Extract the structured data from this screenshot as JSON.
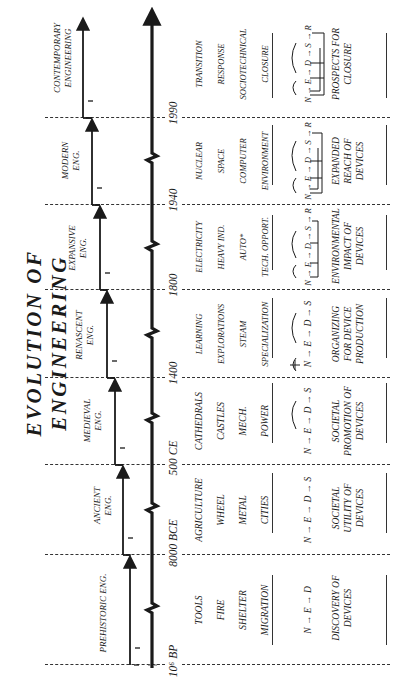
{
  "title": "EVOLUTION OF ENGINEERING",
  "eras": [
    {
      "name": "PREHISTORIC ENG.",
      "start": "10⁶ BP",
      "items": [
        "TOOLS",
        "FIRE",
        "SHELTER",
        "MIGRATION"
      ],
      "equation": "N → E → D",
      "summary": "DISCOVERY OF DEVICES"
    },
    {
      "name": "ANCIENT ENG.",
      "start": "8000 BCE",
      "items": [
        "AGRICULTURE",
        "WHEEL",
        "METAL",
        "CITIES"
      ],
      "equation": "N → E → D → S",
      "summary": "SOCIETAL UTILITY OF DEVICES"
    },
    {
      "name": "MEDIEVAL ENG.",
      "start": "500 CE",
      "items": [
        "CATHEDRALS",
        "CASTLES",
        "MECH.",
        "POWER"
      ],
      "equation": "N → E → D → S",
      "summary": "SOCIETAL PROMOTION OF DEVICES"
    },
    {
      "name": "RENASCENT ENG.",
      "start": "1400",
      "items": [
        "LEARNING",
        "EXPLORATIONS",
        "STEAM",
        "SPECIALIZATION"
      ],
      "equation": "N → E → D → S",
      "summary": "ORGANIZING FOR DEVICE PRODUCTION"
    },
    {
      "name": "EXPANSIVE ENG.",
      "start": "1800",
      "items": [
        "ELECTRICITY",
        "HEAVY IND.",
        "AUTO*",
        "TECH. OPPORT."
      ],
      "equation": "N → E → D → S → R",
      "summary": "ENVIRONMENTAL IMPACT OF DEVICES"
    },
    {
      "name": "MODERN ENG.",
      "start": "1940",
      "items": [
        "NUCLEAR",
        "SPACE",
        "COMPUTER",
        "ENVIRONMENT"
      ],
      "equation": "N → E → D → S → R",
      "summary": "EXPANDED REACH OF DEVICES"
    },
    {
      "name": "CONTEMPORARY ENGINEERING",
      "start": "1990",
      "items": [
        "TRANSITION",
        "RESPONSE",
        "SOCIOTECHNICAL",
        "CLOSURE"
      ],
      "equation": "N → E → D → S → R",
      "summary": "PROSPECTS FOR CLOSURE"
    }
  ],
  "line_color": "#1a1a1a"
}
